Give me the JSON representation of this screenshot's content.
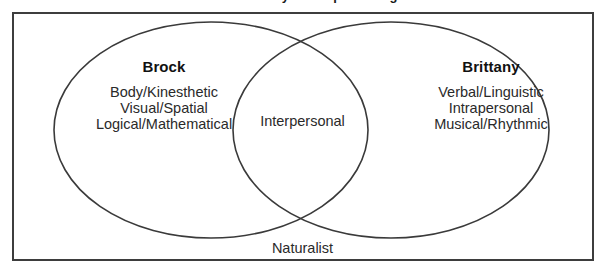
{
  "diagram": {
    "type": "venn-two-set",
    "caption_top_clipped": "Brock and Brittany's Multiple Intelligences",
    "universe_label": "Naturalist",
    "intersection_label": "Interpersonal",
    "border_color": "#3d3d3d",
    "circle_stroke_color": "#3a3a3a",
    "background_color": "#ffffff",
    "text_color": "#2a2a2a"
  },
  "left_set": {
    "title": "Brock",
    "items": [
      "Body/Kinesthetic",
      "Visual/Spatial",
      "Logical/Mathematical"
    ]
  },
  "right_set": {
    "title": "Brittany",
    "items": [
      "Verbal/Linguistic",
      "Intrapersonal",
      "Musical/Rhythmic"
    ]
  },
  "geometry": {
    "left_ellipse": {
      "cx": 211,
      "cy": 130,
      "rx": 157,
      "ry": 108
    },
    "right_ellipse": {
      "cx": 391,
      "cy": 130,
      "rx": 158,
      "ry": 108
    },
    "box": {
      "x": 12,
      "y": 12,
      "width": 582,
      "height": 249
    }
  }
}
